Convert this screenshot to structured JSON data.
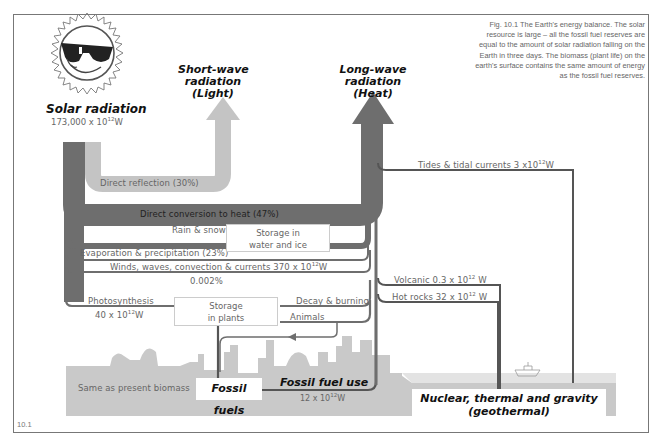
{
  "figure": {
    "number": "10.1",
    "caption": "Fig. 10.1  The Earth's energy balance. The solar resource is large – all the fossil fuel reserves are equal to the amount of solar radiation falling on the Earth in three days. The biomass (plant life) on the earth's surface contains the same amount of energy as the fossil fuel reserves."
  },
  "sources": {
    "solar": {
      "title": "Solar radiation",
      "value": "173,000 x 10",
      "exp": "12",
      "unit": "W",
      "icon": "sun-with-sunglasses-icon"
    },
    "nuclear": {
      "title_line1": "Nuclear, thermal and gravity",
      "title_line2": "(geothermal)"
    }
  },
  "outputs": {
    "short_wave": {
      "line1": "Short-wave",
      "line2": "radiation",
      "line3": "(Light)"
    },
    "long_wave": {
      "line1": "Long-wave",
      "line2": "radiation",
      "line3": "(Heat)"
    }
  },
  "flows": {
    "direct_reflection": "Direct reflection (30%)",
    "direct_conversion": "Direct conversion to heat (47%)",
    "rain_snow": "Rain & snow",
    "evaporation": "Evaporation & precipitation (23%)",
    "winds": {
      "text": "Winds, waves, convection & currents 370 x 10",
      "exp": "12",
      "unit": "W"
    },
    "photosynthesis_pct": "0.002%",
    "photosynthesis": "Photosynthesis",
    "photosynthesis_value": {
      "text": "40 x 10",
      "exp": "12",
      "unit": "W"
    },
    "decay_burning": "Decay & burning",
    "animals": "Animals",
    "tides": {
      "text": "Tides & tidal currents 3 x10",
      "exp": "12",
      "unit": "W"
    },
    "volcanic": {
      "text": "Volcanic 0.3 x 10",
      "exp": "12",
      "unit": " W"
    },
    "hot_rocks": {
      "text": "Hot rocks 32 x 10",
      "exp": "12",
      "unit": " W"
    }
  },
  "stores": {
    "water_ice": {
      "line1": "Storage in",
      "line2": "water and ice"
    },
    "plants": {
      "line1": "Storage",
      "line2": "in plants"
    },
    "fossil_fuels": "Fossil fuels",
    "biomass_note": "Same as present biomass"
  },
  "fossil_fuel_use": {
    "title": "Fossil fuel use",
    "text": "12 x 10",
    "exp": "12",
    "unit": "W"
  },
  "colors": {
    "dark_flow": "#6e6e6e",
    "light_flow": "#c4c4c4",
    "ground": "#c9c9c9",
    "sea": "#e0e0e0",
    "line": "#555555"
  }
}
